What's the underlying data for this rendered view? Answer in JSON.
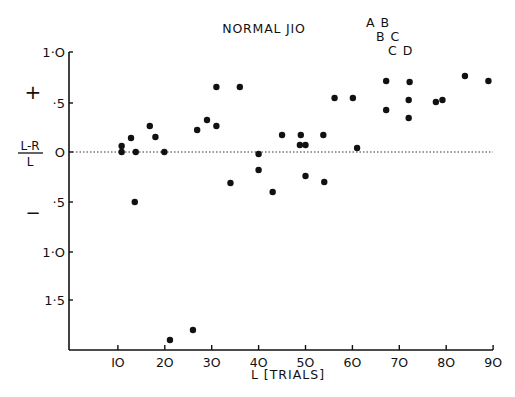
{
  "chart_data": {
    "type": "scatter",
    "annotations": [
      "A B",
      "B C",
      "C D"
    ],
    "xlabel": "L [TRIALS]",
    "ylabel": "L-R / L",
    "y_sign_labels": {
      "positive": "+",
      "negative": "−"
    },
    "x_ticks": [
      10,
      20,
      30,
      40,
      50,
      60,
      70,
      80,
      90
    ],
    "y_ticks": [
      {
        "value": 1.0,
        "label": "1·O"
      },
      {
        "value": 0.5,
        "label": "·5"
      },
      {
        "value": 0,
        "label": "O"
      },
      {
        "value": -0.5,
        "label": "·5"
      },
      {
        "value": -1.0,
        "label": "1·O"
      },
      {
        "value": -1.5,
        "label": "1·5"
      }
    ],
    "xlim": [
      0,
      90
    ],
    "ylim": [
      -2.0,
      1.0
    ],
    "reference_line": {
      "y": 0,
      "style": "dotted"
    },
    "points": [
      {
        "x": 10.8,
        "y": 0.06
      },
      {
        "x": 10.8,
        "y": 0.0
      },
      {
        "x": 12.8,
        "y": 0.14
      },
      {
        "x": 13.8,
        "y": 0.0
      },
      {
        "x": 13.6,
        "y": -0.5
      },
      {
        "x": 16.8,
        "y": 0.26
      },
      {
        "x": 18.0,
        "y": 0.15
      },
      {
        "x": 19.9,
        "y": 0.0
      },
      {
        "x": 21.1,
        "y": -1.88
      },
      {
        "x": 26.0,
        "y": -1.78
      },
      {
        "x": 26.9,
        "y": 0.22
      },
      {
        "x": 29.0,
        "y": 0.32
      },
      {
        "x": 31.0,
        "y": 0.26
      },
      {
        "x": 31.0,
        "y": 0.65
      },
      {
        "x": 34.0,
        "y": -0.31
      },
      {
        "x": 36.0,
        "y": 0.65
      },
      {
        "x": 40.0,
        "y": -0.02
      },
      {
        "x": 40.0,
        "y": -0.18
      },
      {
        "x": 43.0,
        "y": -0.4
      },
      {
        "x": 45.0,
        "y": 0.17
      },
      {
        "x": 48.8,
        "y": 0.07
      },
      {
        "x": 49.0,
        "y": 0.17
      },
      {
        "x": 50.0,
        "y": 0.07
      },
      {
        "x": 50.0,
        "y": -0.24
      },
      {
        "x": 53.8,
        "y": 0.17
      },
      {
        "x": 54.0,
        "y": -0.3
      },
      {
        "x": 56.2,
        "y": 0.54
      },
      {
        "x": 60.1,
        "y": 0.54
      },
      {
        "x": 61.0,
        "y": 0.04
      },
      {
        "x": 67.2,
        "y": 0.71
      },
      {
        "x": 67.2,
        "y": 0.42
      },
      {
        "x": 72.2,
        "y": 0.7
      },
      {
        "x": 72.0,
        "y": 0.52
      },
      {
        "x": 72.0,
        "y": 0.34
      },
      {
        "x": 77.8,
        "y": 0.5
      },
      {
        "x": 79.2,
        "y": 0.52
      },
      {
        "x": 84.0,
        "y": 0.76
      },
      {
        "x": 89.0,
        "y": 0.71
      }
    ],
    "grid": false,
    "legend": null
  }
}
